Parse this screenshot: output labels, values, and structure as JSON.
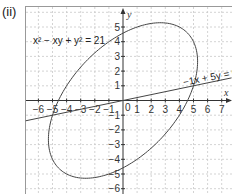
{
  "part_label": "(ii)",
  "equations": {
    "ellipse": "x² − xy + y² = 21",
    "line": "−1x + 5y = 0"
  },
  "axes": {
    "x_label": "x",
    "y_label": "y",
    "origin_label": "0",
    "x_ticks": [
      "-6",
      "-5",
      "-4",
      "-3",
      "-2",
      "-1",
      "1",
      "2",
      "3",
      "4",
      "5",
      "6",
      "7"
    ],
    "y_ticks": [
      "5",
      "4",
      "3",
      "2",
      "1",
      "-1",
      "-2",
      "-3",
      "-4",
      "-5",
      "-6"
    ]
  },
  "colors": {
    "curve": "#444444",
    "grid": "#c8c8c8",
    "axis": "#333333",
    "frame": "#999999"
  },
  "chart_data": {
    "type": "line",
    "title": "",
    "xlabel": "x",
    "ylabel": "y",
    "xlim": [
      -6.9,
      7.7
    ],
    "ylim": [
      -6.4,
      6.4
    ],
    "grid": true,
    "series": [
      {
        "name": "x² − xy + y² = 21",
        "kind": "ellipse",
        "semi_major": 6.48,
        "semi_minor": 3.74,
        "rotation_deg": 45
      },
      {
        "name": "−1x + 5y = 0",
        "kind": "line",
        "slope": 0.2,
        "intercept": 0
      }
    ],
    "annotations": [
      "x² − xy + y² = 21",
      "−1x + 5y = 0"
    ]
  }
}
